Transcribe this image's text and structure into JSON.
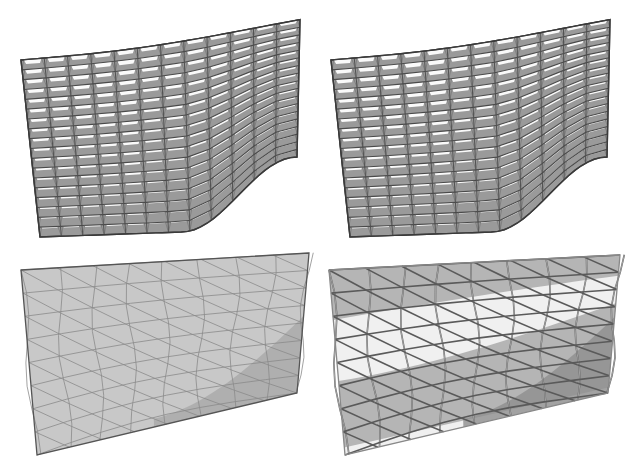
{
  "figure": {
    "panels": [
      {
        "id": "top-left",
        "description": "Deformed kirigami-style lattice mesh with open trapezoidal cells, view 1"
      },
      {
        "id": "top-right",
        "description": "Deformed kirigami-style lattice mesh with open trapezoidal cells, view 2"
      },
      {
        "id": "bottom-left",
        "description": "Flat triangulated panel with shaded deformation region"
      },
      {
        "id": "bottom-right",
        "description": "Triangulated panel with light band and dark shaded regions"
      }
    ],
    "colors": {
      "background": "#ffffff",
      "mesh_fill": "#9a9a9a",
      "mesh_stroke": "#4a4a4a",
      "cell_hole": "#ffffff",
      "panel_fill": "#c8c8c8",
      "panel_shade": "#a9a9a9",
      "panel_light": "#f0f0f0",
      "panel_edge": "#555555"
    },
    "lattice": {
      "rows": 18,
      "cols": 12
    }
  }
}
